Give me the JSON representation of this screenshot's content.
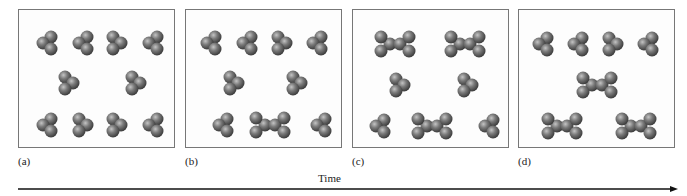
{
  "figure": {
    "time_label": "Time",
    "panels": [
      {
        "label": "(a)",
        "monomers": 10,
        "dimers": 0
      },
      {
        "label": "(b)",
        "monomers": 8,
        "dimers": 1
      },
      {
        "label": "(c)",
        "monomers": 6,
        "dimers": 3
      },
      {
        "label": "(d)",
        "monomers": 4,
        "dimers": 3
      }
    ],
    "colors": {
      "atom": "#6b6b6b",
      "atom_highlight": "#b0b0b0",
      "frame": "#777777",
      "arrow": "#111111"
    }
  }
}
